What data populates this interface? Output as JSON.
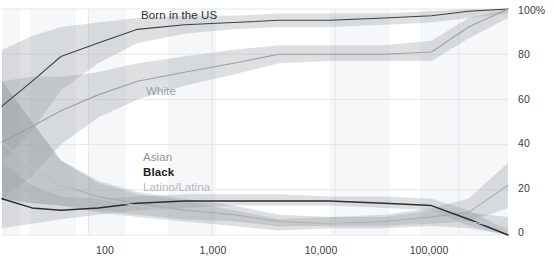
{
  "chart_data": {
    "type": "line",
    "title": "",
    "subtitle": "",
    "xlabel": "",
    "ylabel": "",
    "xscale": "log",
    "xlim": [
      20,
      250000
    ],
    "ylim": [
      0,
      100
    ],
    "grid": true,
    "legend_position": "inline-labels",
    "y_ticks": [
      "0",
      "20",
      "40",
      "60",
      "80",
      "100%"
    ],
    "y_tick_values": [
      0,
      20,
      40,
      60,
      80,
      100
    ],
    "x_ticks": [
      "100",
      "1,000",
      "10,000",
      "100,000"
    ],
    "x_tick_values": [
      100,
      1000,
      10000,
      100000
    ],
    "band_note": "shaded uncertainty bands around each line",
    "series": [
      {
        "name": "Born in the US",
        "color": "#3c4043",
        "label_color": "#2b2f33",
        "x": [
          20,
          35,
          60,
          120,
          250,
          600,
          1500,
          3500,
          9000,
          25000,
          60000,
          120000,
          250000
        ],
        "values": [
          57,
          68,
          79,
          85,
          91,
          93,
          94,
          95,
          95,
          96,
          97,
          99,
          100
        ],
        "band_low": [
          32,
          46,
          64,
          76,
          85,
          89,
          91,
          92,
          92,
          93,
          94,
          96,
          98
        ],
        "band_high": [
          82,
          88,
          92,
          94,
          96,
          97,
          97,
          98,
          98,
          98,
          99,
          100,
          100
        ]
      },
      {
        "name": "White",
        "color": "#9aa0a6",
        "label_color": "#9aa0a6",
        "x": [
          20,
          35,
          60,
          120,
          250,
          600,
          1500,
          3500,
          9000,
          25000,
          60000,
          120000,
          250000
        ],
        "values": [
          41,
          48,
          55,
          62,
          68,
          72,
          76,
          80,
          80,
          80,
          81,
          92,
          100
        ],
        "band_low": [
          16,
          26,
          40,
          52,
          60,
          66,
          71,
          76,
          77,
          77,
          77,
          87,
          96
        ],
        "band_high": [
          68,
          70,
          70,
          72,
          76,
          79,
          82,
          84,
          84,
          84,
          86,
          96,
          100
        ]
      },
      {
        "name": "Asian",
        "color": "#a8aeb4",
        "label_color": "#8d9399",
        "x": [
          20,
          35,
          60,
          120,
          250,
          600,
          1500,
          3500,
          9000,
          25000,
          60000,
          120000,
          250000
        ],
        "values": [
          41,
          30,
          22,
          17,
          14,
          11,
          9,
          6,
          5,
          6,
          8,
          10,
          22
        ],
        "band_low": [
          16,
          14,
          13,
          11,
          9,
          7,
          6,
          4,
          4,
          4,
          5,
          6,
          12
        ],
        "band_high": [
          68,
          50,
          33,
          24,
          19,
          16,
          13,
          9,
          8,
          9,
          12,
          16,
          32
        ]
      },
      {
        "name": "Black",
        "color": "#2b2f33",
        "label_color": "#202326",
        "x": [
          20,
          35,
          60,
          120,
          250,
          600,
          1500,
          3500,
          9000,
          25000,
          60000,
          120000,
          250000
        ],
        "values": [
          16,
          12,
          11,
          12,
          14,
          15,
          15,
          15,
          15,
          14,
          13,
          7,
          0
        ],
        "band_low": [
          3,
          5,
          7,
          9,
          11,
          12,
          13,
          13,
          13,
          12,
          11,
          4,
          0
        ],
        "band_high": [
          32,
          22,
          17,
          16,
          17,
          18,
          18,
          18,
          17,
          17,
          16,
          11,
          2
        ]
      },
      {
        "name": "Latino/Latina",
        "color": "#c0c5ca",
        "label_color": "#b3b8bd",
        "x": [
          20,
          35,
          60,
          120,
          250,
          600,
          1500,
          3500,
          9000,
          25000,
          60000,
          120000,
          250000
        ],
        "values": [
          41,
          30,
          22,
          16,
          13,
          10,
          7,
          4,
          5,
          5,
          7,
          6,
          3
        ],
        "band_low": [
          16,
          14,
          13,
          10,
          8,
          6,
          4,
          2,
          3,
          3,
          4,
          3,
          0
        ],
        "band_high": [
          68,
          50,
          33,
          23,
          18,
          15,
          11,
          7,
          8,
          8,
          11,
          10,
          8
        ]
      }
    ]
  },
  "labels": {
    "born_in_the_us": "Born in the US",
    "white": "White",
    "asian": "Asian",
    "black": "Black",
    "latino_latina": "Latino/Latina"
  },
  "axes": {
    "y": {
      "t100": "100%",
      "t80": "80",
      "t60": "60",
      "t40": "40",
      "t20": "20",
      "t0": "0"
    },
    "x": {
      "t100": "100",
      "t1000": "1,000",
      "t10000": "10,000",
      "t100000": "100,000"
    }
  },
  "colors": {
    "line_dark": "#2b2f33",
    "line_mid": "#9aa0a6",
    "line_light": "#c0c5ca",
    "grid": "#e4e6e8",
    "band_fill": "#9aa0a6"
  }
}
